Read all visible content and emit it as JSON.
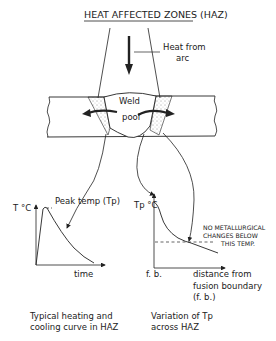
{
  "title": "HEAT AFFECTED ZONES (HAZ)",
  "weld": {
    "heat_label_1": "Heat from",
    "heat_label_2": "arc",
    "pool_label_1": "Weld",
    "pool_label_2": "pool"
  },
  "left_chart": {
    "y_label": "T °C",
    "x_label": "time",
    "peak_label": "Peak temp (Tp)",
    "caption_1": "Typical heating and",
    "caption_2": "cooling curve in HAZ"
  },
  "right_chart": {
    "y_label": "Tp °C",
    "x_origin_label": "f. b.",
    "x_label_1": "distance from",
    "x_label_2": "fusion boundary",
    "x_label_3": "(f. b.)",
    "note_1": "NO METALLURGICAL",
    "note_2": "CHANGES BELOW",
    "note_3": "THIS TEMP.",
    "caption_1": "Variation of Tp",
    "caption_2": "across HAZ"
  },
  "colors": {
    "ink": "#222222",
    "background": "#ffffff"
  }
}
